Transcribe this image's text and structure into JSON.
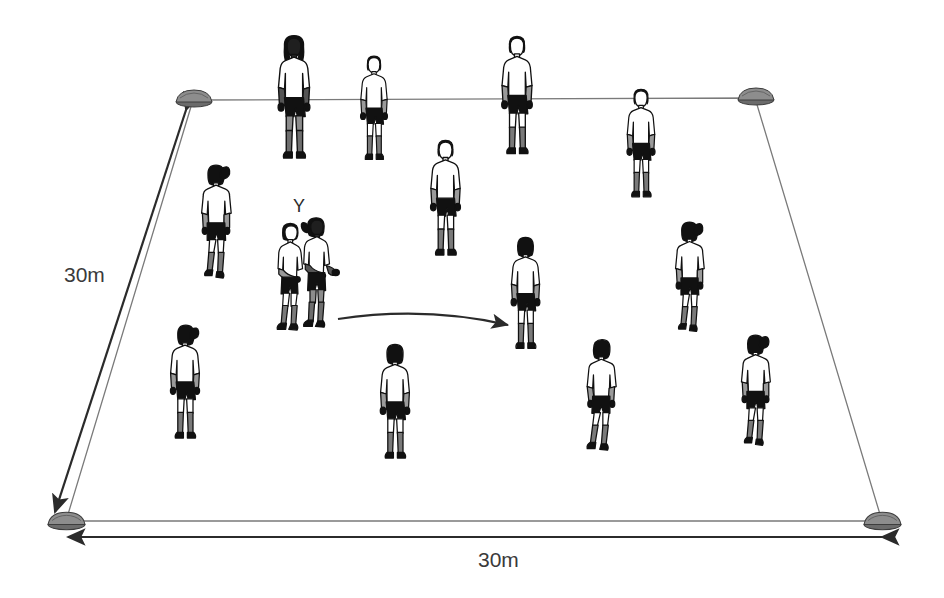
{
  "diagram": {
    "background_color": "#ffffff",
    "line_color": "#6e6e6e",
    "arrow_color": "#2b2b2b",
    "skin_tone_light": "#ffffff",
    "skin_tone_dark": "#1a1a1a",
    "shirt_color": "#ffffff",
    "shorts_color": "#111111",
    "socks_color": "#7a7a7a",
    "boots_color": "#111111"
  },
  "labels": {
    "left_dimension": "30m",
    "bottom_dimension": "30m",
    "pair_marker": "Y"
  },
  "grid": {
    "corners": [
      {
        "name": "top-left",
        "x": 193,
        "y": 100
      },
      {
        "name": "top-right",
        "x": 755,
        "y": 98
      },
      {
        "name": "bottom-right",
        "x": 882,
        "y": 521
      },
      {
        "name": "bottom-left",
        "x": 66,
        "y": 521
      }
    ],
    "cone_count": 4,
    "cone_color": "#6b6b6b"
  },
  "dimension_arrows": [
    {
      "name": "left-30m-arrow",
      "x1": 185,
      "y1": 108,
      "x2": 57,
      "y2": 513,
      "double_headed": false,
      "heads": "both"
    },
    {
      "name": "bottom-30m-arrow",
      "x1": 66,
      "y1": 537,
      "x2": 882,
      "y2": 537,
      "heads": "both"
    }
  ],
  "motion_arrow": {
    "name": "run-direction-arrow",
    "from_x": 338,
    "from_y": 318,
    "to_x": 513,
    "to_y": 328,
    "curved": true
  },
  "players": [
    {
      "id": 1,
      "x": 270,
      "y": 33,
      "h": 124,
      "view": "front",
      "pose": "stand",
      "hair": "long-dark",
      "skin": "dark",
      "scale": 1.0,
      "name": "player-top-1"
    },
    {
      "id": 2,
      "x": 353,
      "y": 54,
      "h": 104,
      "view": "front",
      "pose": "stand",
      "hair": "short-dark",
      "skin": "light",
      "scale": 0.85,
      "name": "player-top-2"
    },
    {
      "id": 3,
      "x": 494,
      "y": 34,
      "h": 120,
      "view": "front",
      "pose": "stand",
      "hair": "short-dark",
      "skin": "light",
      "scale": 0.97,
      "name": "player-top-3"
    },
    {
      "id": 4,
      "x": 619,
      "y": 87,
      "h": 110,
      "view": "front",
      "pose": "stand",
      "hair": "short-dark",
      "skin": "light",
      "scale": 0.89,
      "name": "player-top-4"
    },
    {
      "id": 5,
      "x": 193,
      "y": 163,
      "h": 118,
      "view": "back",
      "pose": "walk",
      "hair": "ponytail",
      "skin": "light",
      "scale": 0.95,
      "name": "player-left-upper"
    },
    {
      "id": 6,
      "x": 422,
      "y": 138,
      "h": 120,
      "view": "front",
      "pose": "stand",
      "hair": "short-dark",
      "skin": "light",
      "scale": 0.97,
      "name": "player-center-upper"
    },
    {
      "id": 7,
      "x": 503,
      "y": 236,
      "h": 114,
      "view": "back",
      "pose": "stand",
      "hair": "short-dark",
      "skin": "light",
      "scale": 0.92,
      "name": "player-center-right"
    },
    {
      "id": 8,
      "x": 667,
      "y": 220,
      "h": 112,
      "view": "back",
      "pose": "walk",
      "hair": "ponytail",
      "skin": "light",
      "scale": 0.9,
      "name": "player-right-middle"
    },
    {
      "id": 9,
      "x": 162,
      "y": 323,
      "h": 118,
      "view": "back",
      "pose": "stand",
      "hair": "ponytail",
      "skin": "light",
      "scale": 0.95,
      "name": "player-left-lower"
    },
    {
      "id": 10,
      "x": 372,
      "y": 343,
      "h": 118,
      "view": "back",
      "pose": "stand",
      "hair": "short-dark",
      "skin": "light",
      "scale": 0.95,
      "name": "player-bottom-center"
    },
    {
      "id": 11,
      "x": 578,
      "y": 338,
      "h": 116,
      "view": "back",
      "pose": "walk",
      "hair": "short-dark",
      "skin": "light",
      "scale": 0.94,
      "name": "player-bottom-right-1"
    },
    {
      "id": 12,
      "x": 733,
      "y": 333,
      "h": 112,
      "view": "back",
      "pose": "walk",
      "hair": "ponytail",
      "skin": "light",
      "scale": 0.9,
      "name": "player-bottom-right-2"
    }
  ],
  "pair": {
    "name": "ball-carrier-pair",
    "marker": "Y",
    "left_player": {
      "x": 268,
      "y": 222,
      "h": 112,
      "view": "side",
      "hair": "short-dark",
      "skin": "light",
      "name": "pair-player-left"
    },
    "right_player": {
      "x": 297,
      "y": 216,
      "h": 118,
      "view": "side",
      "hair": "ponytail",
      "skin": "dark",
      "name": "pair-player-right"
    }
  }
}
